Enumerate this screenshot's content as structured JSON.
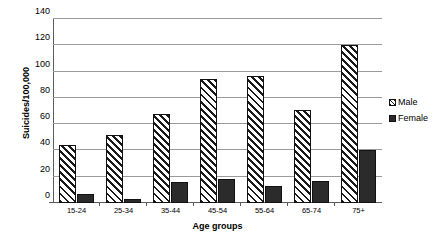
{
  "chart_data": {
    "type": "bar",
    "title": "",
    "xlabel": "Age groups",
    "ylabel": "Suicides/100,000",
    "categories": [
      "15-24",
      "25-34",
      "35-44",
      "45-54",
      "55-64",
      "65-74",
      "75+"
    ],
    "series": [
      {
        "name": "Male",
        "values": [
          44,
          52,
          68,
          94,
          97,
          71,
          120
        ]
      },
      {
        "name": "Female",
        "values": [
          7,
          3,
          16,
          18,
          13,
          17,
          40
        ]
      }
    ],
    "ylim": [
      0,
      140
    ],
    "yticks": [
      0,
      20,
      40,
      60,
      80,
      100,
      120,
      140
    ],
    "ytick_labels": [
      "0",
      "20",
      "40",
      "60",
      "80",
      "100",
      "120",
      "140"
    ],
    "grid": "horizontal",
    "legend_position": "right",
    "colors": {
      "male_fill": "#ffffff",
      "male_hatch": "#1a1a1a",
      "female_fill": "#2b2b2b",
      "gridline": "#9a9a9a",
      "axis": "#5d5d5d",
      "background": "#ffffff"
    }
  },
  "legend": {
    "items": [
      {
        "label": "Male",
        "swatch": "hatched-swatch"
      },
      {
        "label": "Female",
        "swatch": "solid-swatch"
      }
    ]
  }
}
